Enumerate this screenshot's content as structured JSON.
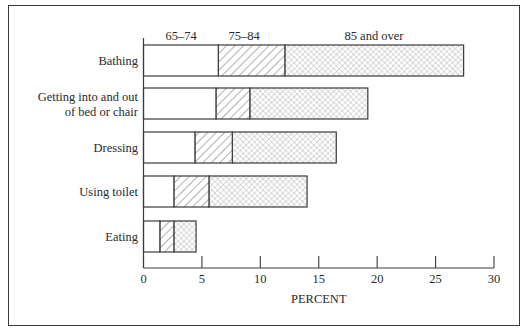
{
  "chart_data": {
    "type": "bar",
    "orientation": "horizontal",
    "layout": "overlapping",
    "title": "",
    "xlabel": "PERCENT",
    "ylabel": "",
    "xlim": [
      0,
      30
    ],
    "xticks": [
      0,
      5,
      10,
      15,
      20,
      25,
      30
    ],
    "grid": false,
    "legend_position": "top (inline labels above first bar)",
    "categories": [
      "Bathing",
      "Getting into and out of bed or chair",
      "Dressing",
      "Using toilet",
      "Eating"
    ],
    "category_lines": [
      [
        "Bathing"
      ],
      [
        "Getting into and out",
        "of bed or chair"
      ],
      [
        "Dressing"
      ],
      [
        "Using toilet"
      ],
      [
        "Eating"
      ]
    ],
    "series": [
      {
        "name": "65–74",
        "pattern": "solid-white",
        "values": [
          6.4,
          6.2,
          4.4,
          2.6,
          1.4
        ]
      },
      {
        "name": "75–84",
        "pattern": "diagonal-hatch",
        "values": [
          12.1,
          9.1,
          7.6,
          5.6,
          2.6
        ]
      },
      {
        "name": "85 and over",
        "pattern": "crosshatch",
        "values": [
          27.4,
          19.2,
          16.5,
          14.0,
          4.5
        ]
      }
    ],
    "colors": {
      "stroke": "#3a3a3a",
      "hatch": "#7a7a7a",
      "cross": "#9a9a9a",
      "fill": "#ffffff"
    }
  }
}
